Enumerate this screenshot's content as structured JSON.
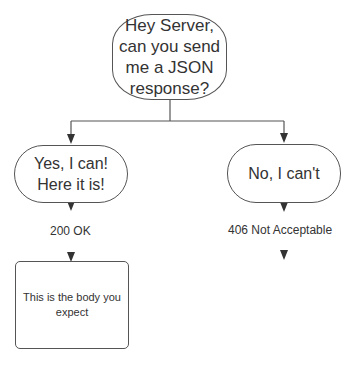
{
  "diagram": {
    "question": "Hey Server, can you send me a JSON response?",
    "yes_node": "Yes, I can! Here it is!",
    "no_node": "No, I can't",
    "yes_status": "200 OK",
    "no_status": "406 Not Acceptable",
    "body_node": "This is the body you expect"
  },
  "colors": {
    "stroke": "#555555",
    "arrow": "#333333",
    "text": "#333333",
    "background": "#ffffff"
  }
}
